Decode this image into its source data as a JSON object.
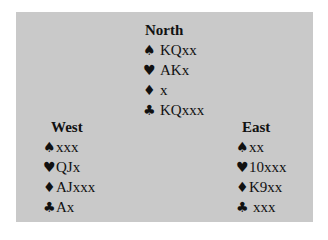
{
  "colors": {
    "panel_background": "#c9c9c9",
    "page_background": "#ffffff",
    "text": "#111111"
  },
  "hands": {
    "north": {
      "label": "North",
      "spades": {
        "icon": "♠",
        "cards": "KQxx"
      },
      "hearts": {
        "icon": "♥",
        "cards": "AKx"
      },
      "diamonds": {
        "icon": "♦",
        "cards": "x"
      },
      "clubs": {
        "icon": "♣",
        "cards": "KQxxx"
      }
    },
    "west": {
      "label": "West",
      "spades": {
        "icon": "♠",
        "cards": "xxx"
      },
      "hearts": {
        "icon": "♥",
        "cards": "QJx"
      },
      "diamonds": {
        "icon": "♦",
        "cards": "AJxxx"
      },
      "clubs": {
        "icon": "♣",
        "cards": "Ax"
      }
    },
    "east": {
      "label": "East",
      "spades": {
        "icon": "♠",
        "cards": "xx"
      },
      "hearts": {
        "icon": "♥",
        "cards": "10xxx"
      },
      "diamonds": {
        "icon": "♦",
        "cards": "K9xx"
      },
      "clubs": {
        "icon": "♣",
        "cards": "xxx"
      }
    }
  }
}
